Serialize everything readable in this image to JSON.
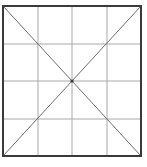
{
  "figure": {
    "title": "Square divided into a 4 by 4 grid with both diagonals drawn",
    "type": "geometric-diagram",
    "canvas": {
      "width": 147,
      "height": 167,
      "background_color": "#ffffff"
    },
    "square": {
      "left": 3,
      "top": 6,
      "right": 141,
      "bottom": 156,
      "width": 138,
      "height": 150,
      "border_color": "#3a3a3a",
      "border_width": 2,
      "fill": "none"
    },
    "grid": {
      "columns": 4,
      "rows": 4,
      "line_color": "#a8a8a8",
      "line_width": 1,
      "vertical_x": [
        38,
        72,
        107
      ],
      "horizontal_y": [
        44,
        81,
        119
      ]
    },
    "diagonals": {
      "count": 2,
      "line_color": "#6e6e6e",
      "line_width": 1,
      "segments": [
        {
          "name": "top-left-to-bottom-right",
          "x1": 3,
          "y1": 6,
          "x2": 141,
          "y2": 156
        },
        {
          "name": "bottom-left-to-top-right",
          "x1": 3,
          "y1": 156,
          "x2": 141,
          "y2": 6
        }
      ]
    },
    "center_point": {
      "x": 72,
      "y": 81,
      "radius": 1.6,
      "color": "#3a3a3a"
    }
  }
}
